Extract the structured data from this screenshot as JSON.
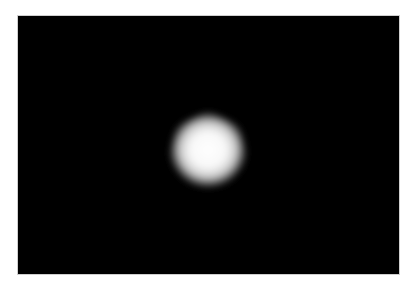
{
  "image": {
    "description": "Black rectangular field with a single bright, soft-edged white heptagonal glow near the center",
    "background_color": "#ffffff",
    "panel_color": "#000000",
    "glow": {
      "shape": "heptagon",
      "center_x": 190,
      "center_y": 136,
      "radius": 42,
      "core_color": "#ffffff",
      "edge_color": "#000000"
    }
  }
}
